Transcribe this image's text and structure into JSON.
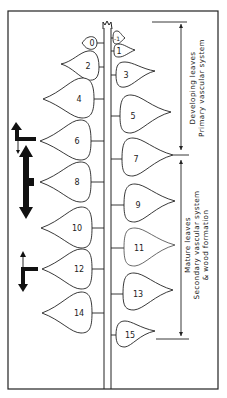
{
  "diagram": {
    "type": "plant-shoot-leaf-development",
    "stem": {
      "apex": "shoot-tip"
    },
    "leaves_left": [
      {
        "label": "0",
        "cy": 43,
        "size": "tiny"
      },
      {
        "label": "2",
        "cy": 67,
        "size": "small"
      },
      {
        "label": "4",
        "cy": 99,
        "size": "large"
      },
      {
        "label": "6",
        "cy": 141,
        "size": "large"
      },
      {
        "label": "8",
        "cy": 182,
        "size": "large"
      },
      {
        "label": "10",
        "cy": 228,
        "size": "large"
      },
      {
        "label": "12",
        "cy": 269,
        "size": "large"
      },
      {
        "label": "14",
        "cy": 313,
        "size": "large"
      }
    ],
    "leaves_right": [
      {
        "label": "-1",
        "cy": 38,
        "size": "tiny"
      },
      {
        "label": "1",
        "cy": 51,
        "size": "tiny"
      },
      {
        "label": "3",
        "cy": 75,
        "size": "small"
      },
      {
        "label": "5",
        "cy": 116,
        "size": "large"
      },
      {
        "label": "7",
        "cy": 159,
        "size": "large"
      },
      {
        "label": "9",
        "cy": 205,
        "size": "large"
      },
      {
        "label": "11",
        "cy": 248,
        "size": "large"
      },
      {
        "label": "13",
        "cy": 294,
        "size": "large"
      },
      {
        "label": "15",
        "cy": 332,
        "size": "small"
      }
    ],
    "brackets": [
      {
        "line1": "Developing leaves",
        "line2": "Primary vascular system",
        "line3": ""
      },
      {
        "line1": "Mature leaves",
        "line2": "Secondary vascular system",
        "line3": "& wood formation"
      }
    ],
    "arrows": [
      {
        "position": "leaf-6",
        "kind": "up-arrow-with-thin-down"
      },
      {
        "position": "leaf-8",
        "kind": "bold-double-headed"
      },
      {
        "position": "leaf-12",
        "kind": "thin-up-bold-down"
      }
    ]
  }
}
